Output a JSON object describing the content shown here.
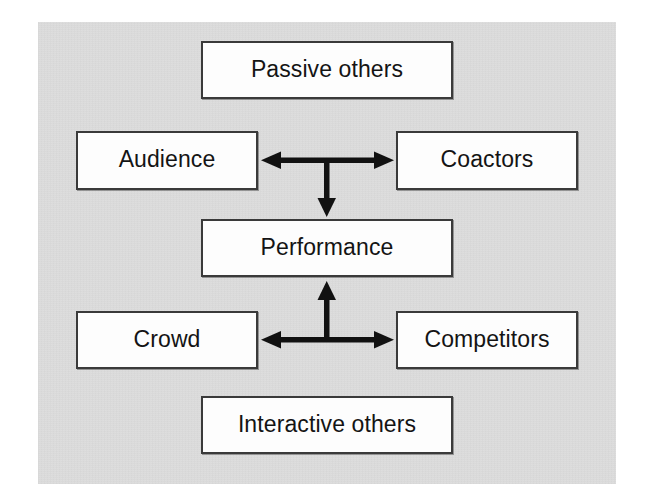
{
  "figure": {
    "background_color": "#dcdcdc",
    "page_color": "#ffffff",
    "box_fill": "#fdfdfd",
    "box_border_color": "#3a3a3a",
    "connector_color": "#111111",
    "text_color": "#141414"
  },
  "nodes": {
    "passive_others": {
      "label": "Passive others"
    },
    "audience": {
      "label": "Audience"
    },
    "coactors": {
      "label": "Coactors"
    },
    "performance": {
      "label": "Performance"
    },
    "crowd": {
      "label": "Crowd"
    },
    "competitors": {
      "label": "Competitors"
    },
    "interactive_others": {
      "label": "Interactive others"
    }
  },
  "connectors": [
    {
      "name": "audience-coactors-link",
      "from": "audience",
      "to": "coactors",
      "direction": "bidirectional",
      "orientation": "horizontal"
    },
    {
      "name": "upper-to-performance-link",
      "from": "audience-coactors-junction",
      "to": "performance",
      "direction": "unidirectional-down",
      "orientation": "vertical"
    },
    {
      "name": "crowd-competitors-link",
      "from": "crowd",
      "to": "competitors",
      "direction": "bidirectional",
      "orientation": "horizontal"
    },
    {
      "name": "lower-to-performance-link",
      "from": "crowd-competitors-junction",
      "to": "performance",
      "direction": "unidirectional-up",
      "orientation": "vertical"
    }
  ],
  "groups": [
    {
      "name": "passive-others-group",
      "header": "Passive others",
      "members": [
        "Audience",
        "Coactors"
      ]
    },
    {
      "name": "interactive-others-group",
      "header": "Interactive others",
      "members": [
        "Crowd",
        "Competitors"
      ]
    }
  ]
}
